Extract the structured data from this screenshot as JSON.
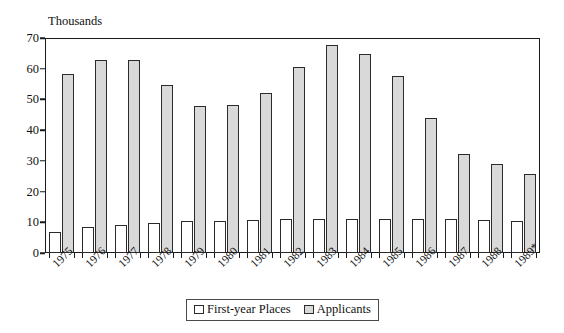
{
  "chart_data": {
    "type": "bar",
    "title": "",
    "unit_label": "Thousands",
    "xlabel": "",
    "ylabel": "",
    "ylim": [
      0,
      70
    ],
    "ytick_step": 10,
    "yticks": [
      0,
      10,
      20,
      30,
      40,
      50,
      60,
      70
    ],
    "grid": false,
    "legend_position": "bottom-center",
    "categories": [
      "1975",
      "1976",
      "1977",
      "1978",
      "1979",
      "1980",
      "1981",
      "1982",
      "1983",
      "1984",
      "1985",
      "1986",
      "1987",
      "1988",
      "1989*"
    ],
    "series": [
      {
        "name": "First-year Places",
        "color": "#ffffff",
        "values": [
          7.0,
          8.5,
          9.2,
          9.8,
          10.3,
          10.3,
          10.8,
          11.0,
          11.2,
          11.2,
          11.0,
          11.0,
          11.0,
          10.8,
          10.5
        ]
      },
      {
        "name": "Applicants",
        "color": "#d9d9d9",
        "values": [
          58.3,
          62.8,
          62.9,
          54.7,
          47.8,
          48.2,
          52.0,
          60.6,
          67.8,
          64.8,
          57.6,
          43.8,
          32.1,
          29.0,
          25.8
        ]
      }
    ],
    "annotations": [
      "* 1989 figure marked provisional"
    ]
  },
  "legend": {
    "items": [
      {
        "label": "First-year Places",
        "swatch": "white-swatch"
      },
      {
        "label": "Applicants",
        "swatch": "gray-swatch"
      }
    ]
  }
}
